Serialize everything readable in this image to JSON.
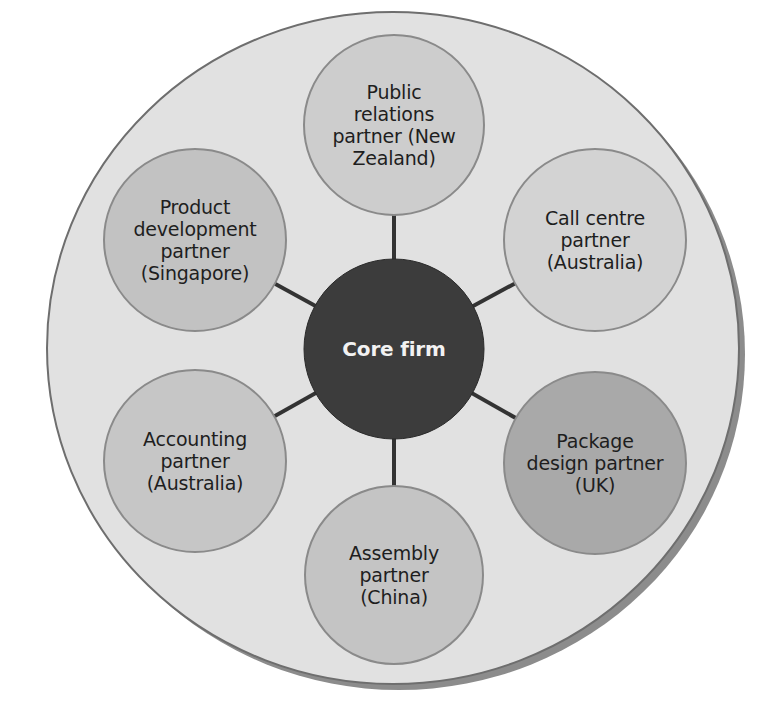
{
  "diagram": {
    "type": "hub-and-spoke network",
    "colors": {
      "background": "#ffffff",
      "outer_fill": "#e1e1e1",
      "outer_border": "#6e6e6e",
      "outer_shadow": "#8c8c8c",
      "core_fill": "#3c3c3c",
      "core_text": "#f2f2f2",
      "connector": "#333333",
      "node_border": "#8a8a8a",
      "node_text": "#1e1e1e"
    },
    "core": {
      "label": "Core firm",
      "cx": 394,
      "cy": 349,
      "r": 90
    },
    "nodes": [
      {
        "id": "public-relations",
        "lines": [
          "Public",
          "relations",
          "partner (New",
          "Zealand)"
        ],
        "cx": 394,
        "cy": 125,
        "r": 90,
        "fill": "#cdcdcd"
      },
      {
        "id": "call-centre",
        "lines": [
          "Call centre",
          "partner",
          "(Australia)"
        ],
        "cx": 595,
        "cy": 240,
        "r": 91,
        "fill": "#d3d3d3"
      },
      {
        "id": "package-design",
        "lines": [
          "Package",
          "design partner",
          "(UK)"
        ],
        "cx": 595,
        "cy": 463,
        "r": 91,
        "fill": "#a9a9a9"
      },
      {
        "id": "assembly",
        "lines": [
          "Assembly",
          "partner",
          "(China)"
        ],
        "cx": 394,
        "cy": 575,
        "r": 89,
        "fill": "#c4c4c4"
      },
      {
        "id": "accounting",
        "lines": [
          "Accounting",
          "partner",
          "(Australia)"
        ],
        "cx": 195,
        "cy": 461,
        "r": 91,
        "fill": "#c6c6c6"
      },
      {
        "id": "product-development",
        "lines": [
          "Product",
          "development",
          "partner",
          "(Singapore)"
        ],
        "cx": 195,
        "cy": 240,
        "r": 91,
        "fill": "#c2c2c2"
      }
    ],
    "outer": {
      "cx": 393,
      "cy": 348,
      "rx": 346,
      "ry": 336
    }
  }
}
